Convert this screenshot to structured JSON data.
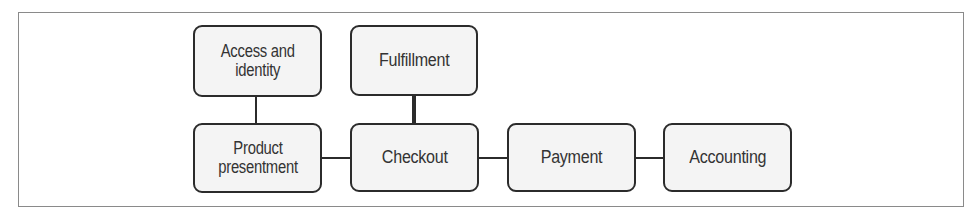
{
  "diagram": {
    "type": "block-diagram",
    "nodes": [
      {
        "id": "access",
        "label": "Access and identity",
        "lines": [
          "Access and",
          "identity"
        ]
      },
      {
        "id": "fulfillment",
        "label": "Fulfillment",
        "lines": [
          "Fulfillment"
        ]
      },
      {
        "id": "product",
        "label": "Product presentment",
        "lines": [
          "Product",
          "presentment"
        ]
      },
      {
        "id": "checkout",
        "label": "Checkout",
        "lines": [
          "Checkout"
        ]
      },
      {
        "id": "payment",
        "label": "Payment",
        "lines": [
          "Payment"
        ]
      },
      {
        "id": "accounting",
        "label": "Accounting",
        "lines": [
          "Accounting"
        ]
      }
    ],
    "edges": [
      {
        "from": "access",
        "to": "product"
      },
      {
        "from": "fulfillment",
        "to": "checkout"
      },
      {
        "from": "product",
        "to": "checkout"
      },
      {
        "from": "checkout",
        "to": "payment"
      },
      {
        "from": "payment",
        "to": "accounting"
      }
    ],
    "colors": {
      "border": "#2b2b2b",
      "fill": "#f4f4f4",
      "text": "#333333",
      "frame": "#8a8a8a"
    }
  }
}
